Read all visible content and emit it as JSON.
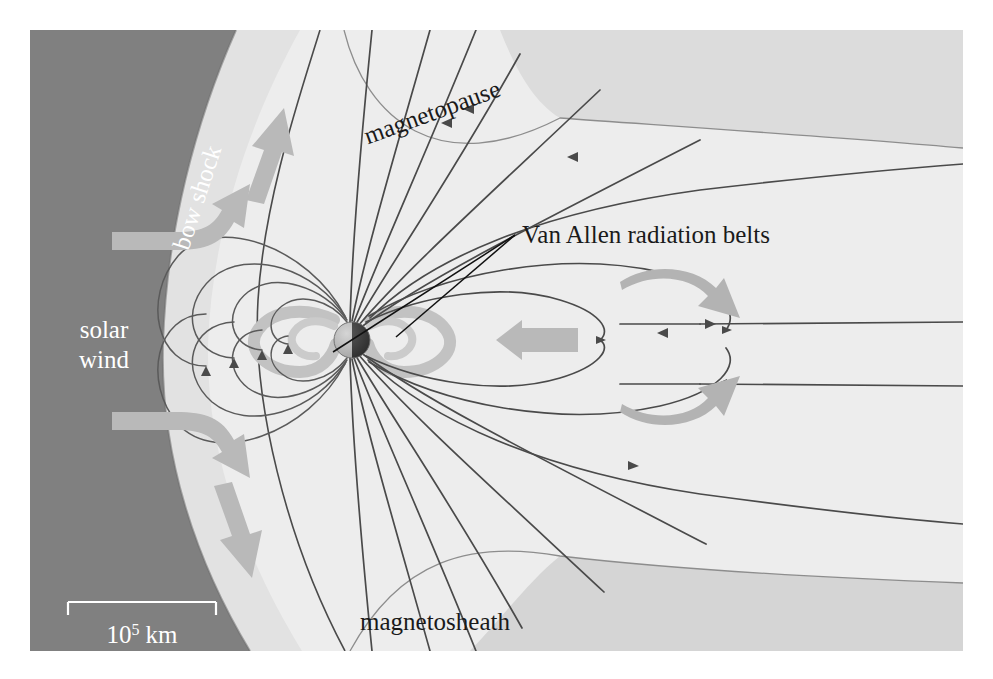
{
  "figure": {
    "width": 993,
    "height": 679
  },
  "labels": {
    "bow_shock": "bow shock",
    "magnetopause": "magnetopause",
    "magnetosheath": "magnetosheath",
    "solar_wind_line1": "solar",
    "solar_wind_line2": "wind",
    "van_allen": "Van Allen radiation belts"
  },
  "scale": {
    "value": "10",
    "exponent": "5",
    "unit": "km",
    "full_label": "10⁵ km"
  },
  "colors": {
    "solar_wind_region": "#808080",
    "magnetosheath_region": "#e2e2e2",
    "magnetosphere_region": "#ededed",
    "outer_band": "#d8d8d8",
    "field_line": "#4a4a4a",
    "flow_arrow": "#b9b9b9",
    "belt": "#bfbfbf",
    "label_dark": "#1a1a1a",
    "label_light": "#ffffff",
    "frame": "#ffffff"
  },
  "earth": {
    "cx": 352,
    "cy": 340,
    "r": 18,
    "day_side": "#b5b5b5",
    "night_side": "#3a3a3a"
  },
  "regions": [
    {
      "name": "solar-wind",
      "description": "dark upstream plasma flow region at left"
    },
    {
      "name": "magnetosheath",
      "description": "light shocked-plasma band between bow shock and magnetopause"
    },
    {
      "name": "magnetosphere",
      "description": "inner cavity containing dipole field lines and magnetotail"
    }
  ],
  "flow_arrows": [
    {
      "name": "solar-wind-arrow-upper",
      "direction": "up-right"
    },
    {
      "name": "solar-wind-arrow-upper-bent",
      "direction": "right-then-up"
    },
    {
      "name": "solar-wind-arrow-lower-bent",
      "direction": "right-then-down"
    },
    {
      "name": "solar-wind-arrow-lower",
      "direction": "down-right"
    },
    {
      "name": "tail-arrow-upper",
      "direction": "right"
    },
    {
      "name": "tail-arrow-lower",
      "direction": "right"
    },
    {
      "name": "plasma-sheet-arrow",
      "direction": "left"
    }
  ]
}
